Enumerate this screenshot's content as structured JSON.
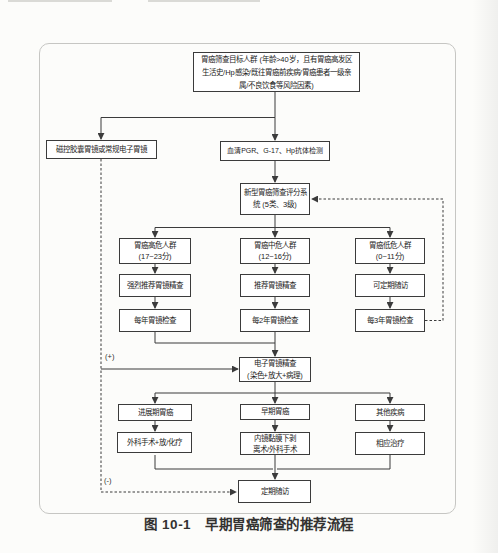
{
  "figure": {
    "caption_prefix": "图 10-1",
    "caption_title": "早期胃癌筛查的推荐流程"
  },
  "flowchart": {
    "line_color": "#3b3b3b",
    "labels": {
      "endoscopy_positive": "(+)",
      "endoscopy_negative": "(-)"
    },
    "nodes": {
      "target_population": "胃癌筛查目标人群 (年龄>40岁，且有胃癌高发区\n生活史/Hp感染/既往胃癌前疾病/胃癌患者一级亲\n属/不良饮食等风险因素)",
      "capsule_endoscopy": "磁控胶囊胃镜或常规电子胃镜",
      "serum_test": "血清PGR、G-17、Hp抗体检测",
      "scoring_system": "新型胃癌筛查评分系\n统 (5类、3级)",
      "high_risk": "胃癌高危人群\n(17~23分)",
      "medium_risk": "胃癌中危人群\n(12~16分)",
      "low_risk": "胃癌低危人群\n(0~11分)",
      "high_risk_action": "强烈推荐胃镜精查",
      "medium_risk_action": "推荐胃镜精查",
      "low_risk_action": "可定期随访",
      "high_risk_interval": "每年胃镜检查",
      "medium_risk_interval": "每2年胃镜检查",
      "low_risk_interval": "每3年胃镜检查",
      "detailed_endoscopy": "电子胃镜精查\n(染色+放大+病理)",
      "advanced_cancer": "进展期胃癌",
      "early_cancer": "早期胃癌",
      "other_disease": "其他疾病",
      "advanced_treatment": "外科手术+放/化疗",
      "early_treatment": "内镜黏膜下剥\n离术/外科手术",
      "other_treatment": "相应治疗",
      "follow_up": "定期随访"
    }
  }
}
